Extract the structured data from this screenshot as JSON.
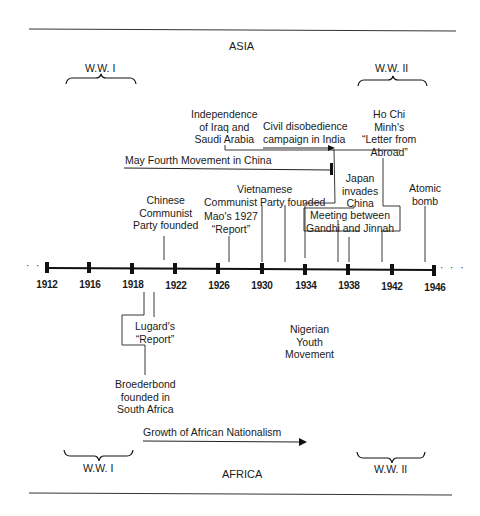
{
  "regions": {
    "top": "ASIA",
    "bottom": "AFRICA"
  },
  "wars": {
    "ww1_top": "W.W. I",
    "ww2_top": "W.W. II",
    "ww1_bottom": "W.W. I",
    "ww2_bottom": "W.W. II"
  },
  "axis": {
    "continuation": "· · ·",
    "years": [
      "1912",
      "1916",
      "1918",
      "1922",
      "1926",
      "1930",
      "1934",
      "1938",
      "1942",
      "1946"
    ]
  },
  "asia_events": {
    "iraq_saudi": [
      "Independence",
      "of Iraq and",
      "Saudi Arabia"
    ],
    "civil_disobedience": [
      "Civil disobedience",
      "campaign in India"
    ],
    "may_fourth": "May Fourth Movement in China",
    "ho_chi_minh": [
      "Ho Chi",
      "Minh's",
      "“Letter from",
      "Abroad”"
    ],
    "chinese_communist": [
      "Chinese",
      "Communist",
      "Party founded"
    ],
    "mao_report": [
      "Mao's 1927",
      "“Report”"
    ],
    "vietnamese_communist": [
      "Vietnamese",
      "Communist Party founded"
    ],
    "japan_invades": [
      "Japan",
      "invades",
      "China"
    ],
    "gandhi_jinnah": [
      "Meeting between",
      "Gandhi and Jinnah"
    ],
    "atomic_bomb": [
      "Atomic",
      "bomb"
    ]
  },
  "africa_events": {
    "lugard_report": [
      "Lugard's",
      "“Report”"
    ],
    "nigerian_youth": [
      "Nigerian",
      "Youth",
      "Movement"
    ],
    "broederbond": [
      "Broederbond",
      "founded in",
      "South Africa"
    ],
    "african_nationalism": "Growth of African Nationalism"
  }
}
